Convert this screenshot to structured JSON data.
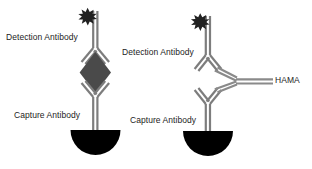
{
  "figure": {
    "background_color": "#ffffff",
    "line_color": "#7d7d7d",
    "antigen_color": "#4a4a4a",
    "well_color": "#000000",
    "label_color": "#1c1c1c"
  },
  "panels": [
    {
      "id": "normal-sandwich-assay",
      "name": "Sandwich immunoassay with antigen",
      "labels": {
        "detection_antibody": "Detection Antibody",
        "capture_antibody": "Capture Antibody"
      },
      "elements": {
        "reporter_star": "star-burst-icon",
        "antigen": "diamond-antigen",
        "well": "solid-phase-well"
      }
    },
    {
      "id": "hama-interference-assay",
      "name": "Sandwich immunoassay bridged by HAMA",
      "labels": {
        "detection_antibody": "Detection Antibody",
        "capture_antibody": "Capture Antibody",
        "hama": "HAMA"
      },
      "elements": {
        "reporter_star": "star-burst-icon",
        "bridge": "hama-bridge-antibody",
        "well": "solid-phase-well"
      }
    }
  ]
}
